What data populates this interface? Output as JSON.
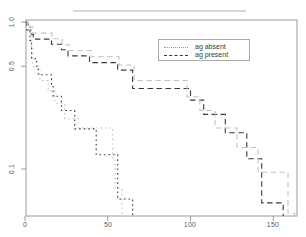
{
  "axes": {
    "x_tick_labels": [
      "0",
      "50",
      "100",
      "150"
    ],
    "y_tick_labels": [
      "1.0",
      "0.5",
      "0.1"
    ]
  },
  "legend": {
    "entries": [
      {
        "label": "ag absent",
        "style": "dotted",
        "color": "#9a9a9a"
      },
      {
        "label": "ag present",
        "style": "dashed",
        "color": "#3a3a3a"
      }
    ]
  },
  "colors": {
    "axis": "#9c9c9c",
    "curve_dark": "#3b3b3b",
    "curve_light": "#c2c2c2",
    "tick_text": "#5a5a5a"
  },
  "chart_data": {
    "type": "line",
    "subtype": "step-survival-curves",
    "title": "",
    "xlabel": "",
    "ylabel": "",
    "x_ticks": [
      0,
      50,
      100,
      150
    ],
    "y_ticks": [
      1.0,
      0.5,
      0.1
    ],
    "y_scale": "log10",
    "xlim": [
      0,
      164
    ],
    "ylim": [
      0.045,
      1.05
    ],
    "grid": false,
    "legend_position": "upper-middle-right",
    "series": [
      {
        "name": "ag absent",
        "estimator": "Kaplan-Meier",
        "style": "dotted",
        "shade": "dark",
        "start_survival": 1.0,
        "steps": [
          [
            2,
            0.9375
          ],
          [
            3,
            0.75
          ],
          [
            4,
            0.5625
          ],
          [
            7,
            0.5
          ],
          [
            8,
            0.4375
          ],
          [
            16,
            0.375
          ],
          [
            17,
            0.3125
          ],
          [
            22,
            0.25
          ],
          [
            30,
            0.1875
          ],
          [
            43,
            0.125
          ],
          [
            56,
            0.0625
          ],
          [
            65,
            0
          ]
        ]
      },
      {
        "name": "ag present",
        "estimator": "Kaplan-Meier",
        "style": "dashed",
        "shade": "dark",
        "start_survival": 1.0,
        "steps": [
          [
            1,
            0.8824
          ],
          [
            4,
            0.8235
          ],
          [
            5,
            0.7647
          ],
          [
            16,
            0.7059
          ],
          [
            22,
            0.6471
          ],
          [
            26,
            0.5882
          ],
          [
            39,
            0.5294
          ],
          [
            56,
            0.4706
          ],
          [
            65,
            0.3529
          ],
          [
            100,
            0.2941
          ],
          [
            108,
            0.2353
          ],
          [
            121,
            0.1765
          ],
          [
            134,
            0.1176
          ],
          [
            143,
            0.0588
          ],
          [
            156,
            0
          ]
        ]
      },
      {
        "name": "ag absent (fitted)",
        "estimator": "model fit",
        "style": "dotted",
        "shade": "light",
        "start_survival": 0.97,
        "steps": [
          [
            2.4,
            0.84
          ],
          [
            3.6,
            0.67
          ],
          [
            4.8,
            0.5
          ],
          [
            9,
            0.4
          ],
          [
            14,
            0.34
          ],
          [
            18,
            0.28
          ],
          [
            24,
            0.22
          ],
          [
            32,
            0.19
          ],
          [
            53,
            0.115
          ],
          [
            54.5,
            0.074
          ],
          [
            58.6,
            0
          ]
        ]
      },
      {
        "name": "ag present (fitted)",
        "estimator": "model fit",
        "style": "dashed",
        "shade": "light",
        "start_survival": 1.0,
        "steps": [
          [
            1.8,
            0.925
          ],
          [
            4.8,
            0.84
          ],
          [
            16.3,
            0.77
          ],
          [
            22.4,
            0.7
          ],
          [
            26.6,
            0.64
          ],
          [
            39.9,
            0.58
          ],
          [
            56.8,
            0.51
          ],
          [
            65.9,
            0.4
          ],
          [
            97.9,
            0.31
          ],
          [
            105.7,
            0.25
          ],
          [
            114.8,
            0.19
          ],
          [
            128.1,
            0.14
          ],
          [
            140.8,
            0.095
          ],
          [
            158.9,
            0.05
          ],
          [
            163,
            0
          ]
        ]
      }
    ]
  }
}
